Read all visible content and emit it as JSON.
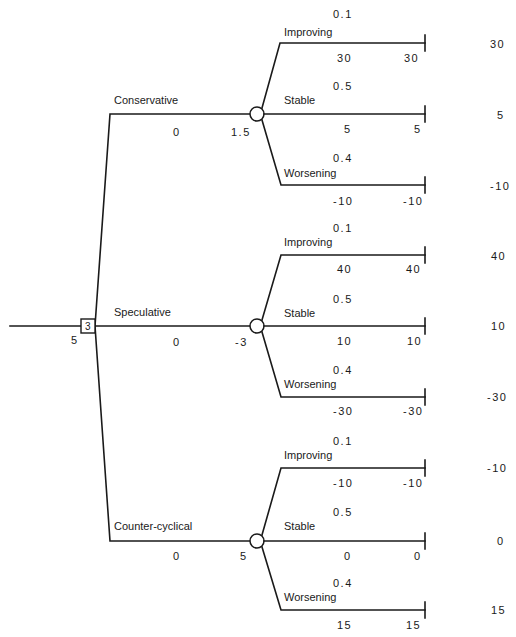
{
  "decision_node": {
    "label": "3",
    "value": "5"
  },
  "alternatives": [
    {
      "name": "Conservative",
      "cost": "0",
      "expected_value": "1.5",
      "outcomes": [
        {
          "state": "Improving",
          "probability": "0.1",
          "payoff": "30",
          "cumulative": "30",
          "terminal": "30"
        },
        {
          "state": "Stable",
          "probability": "0.5",
          "payoff": "5",
          "cumulative": "5",
          "terminal": "5"
        },
        {
          "state": "Worsening",
          "probability": "0.4",
          "payoff": "-10",
          "cumulative": "-10",
          "terminal": "-10"
        }
      ]
    },
    {
      "name": "Speculative",
      "cost": "0",
      "expected_value": "-3",
      "outcomes": [
        {
          "state": "Improving",
          "probability": "0.1",
          "payoff": "40",
          "cumulative": "40",
          "terminal": "40"
        },
        {
          "state": "Stable",
          "probability": "0.5",
          "payoff": "10",
          "cumulative": "10",
          "terminal": "10"
        },
        {
          "state": "Worsening",
          "probability": "0.4",
          "payoff": "-30",
          "cumulative": "-30",
          "terminal": "-30"
        }
      ]
    },
    {
      "name": "Counter-cyclical",
      "cost": "0",
      "expected_value": "5",
      "outcomes": [
        {
          "state": "Improving",
          "probability": "0.1",
          "payoff": "-10",
          "cumulative": "-10",
          "terminal": "-10"
        },
        {
          "state": "Stable",
          "probability": "0.5",
          "payoff": "0",
          "cumulative": "0",
          "terminal": "0"
        },
        {
          "state": "Worsening",
          "probability": "0.4",
          "payoff": "15",
          "cumulative": "15",
          "terminal": "15"
        }
      ]
    }
  ]
}
